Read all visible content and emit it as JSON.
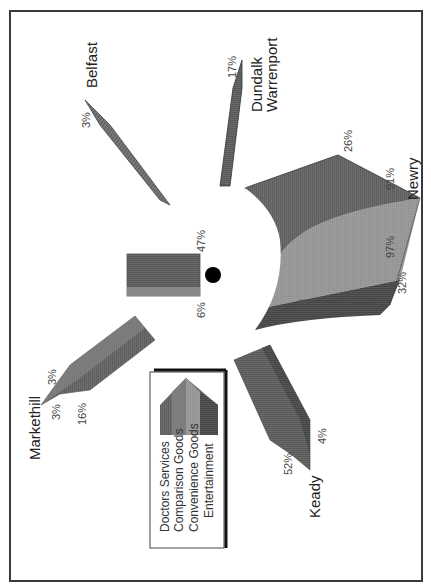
{
  "diagram": {
    "type": "radial-shape-diagram",
    "orientation": "rotated 90deg clockwise",
    "center_bar": {
      "labels": {
        "left": "6%",
        "right": "47%"
      }
    },
    "towns": [
      {
        "name": "Belfast",
        "values": {
          "tip": "3%"
        }
      },
      {
        "name_line1": "Dundalk",
        "name_line2": "Warrenport",
        "values": {
          "tip": "17%"
        }
      },
      {
        "name": "Newry",
        "values": {
          "top": "26%",
          "upper_right": "91%",
          "lower_right": "97%",
          "bottom": "32%"
        }
      },
      {
        "name": "Keady",
        "values": {
          "left": "52%",
          "right": "4%"
        }
      },
      {
        "name": "Markethill",
        "values": {
          "top": "3%",
          "tip": "3%",
          "bottom": "16%"
        }
      }
    ],
    "legend": {
      "items": [
        {
          "label": "Doctors Services",
          "color": "#6e6e6e"
        },
        {
          "label": "Comparison Goods",
          "color": "#808080"
        },
        {
          "label": "Convenience Goods",
          "color": "#9a9a9a"
        },
        {
          "label": "Entertainment",
          "color": "#555555"
        }
      ]
    },
    "colors": {
      "frame": "#3a3a3a",
      "dark": "#555555",
      "mid": "#6e6e6e",
      "light": "#9a9a9a",
      "dot": "#000000"
    }
  }
}
